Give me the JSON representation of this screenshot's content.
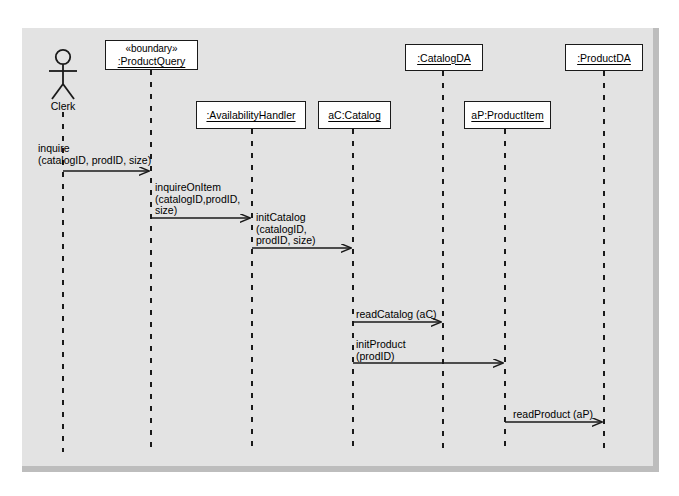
{
  "diagram": {
    "type": "uml-sequence-diagram",
    "background_color": "#e3e3e3",
    "frame_border_color": "#bdbdbd",
    "line_color": "#1a1a1a",
    "box_fill": "#ffffff",
    "actor": {
      "name": "actor-clerk",
      "label": "Clerk",
      "x": 63,
      "head_cy": 58,
      "lifeline_top": 104,
      "lifeline_bottom": 452
    },
    "lifelines": [
      {
        "id": "productquery",
        "stereotype": "«boundary»",
        "label": ":ProductQuery",
        "x": 151,
        "box": {
          "left": 105,
          "top": 40,
          "width": 93,
          "height": 30
        },
        "lifeline_top": 70,
        "lifeline_bottom": 452
      },
      {
        "id": "availabilityhandler",
        "stereotype": "",
        "label": ":AvailabilityHandler",
        "x": 252,
        "box": {
          "left": 196,
          "top": 101,
          "width": 110,
          "height": 28
        },
        "lifeline_top": 129,
        "lifeline_bottom": 452
      },
      {
        "id": "accatalog",
        "stereotype": "",
        "label": "aC:Catalog",
        "x": 353,
        "box": {
          "left": 318,
          "top": 101,
          "width": 73,
          "height": 28
        },
        "lifeline_top": 129,
        "lifeline_bottom": 452
      },
      {
        "id": "catalogda",
        "stereotype": "",
        "label": ":CatalogDA",
        "x": 443,
        "box": {
          "left": 405,
          "top": 44,
          "width": 78,
          "height": 27
        },
        "lifeline_top": 71,
        "lifeline_bottom": 452
      },
      {
        "id": "approductitem",
        "stereotype": "",
        "label": "aP:ProductItem",
        "x": 505,
        "box": {
          "left": 464,
          "top": 101,
          "width": 87,
          "height": 28
        },
        "lifeline_top": 129,
        "lifeline_bottom": 452
      },
      {
        "id": "productda",
        "stereotype": "",
        "label": ":ProductDA",
        "x": 604,
        "box": {
          "left": 565,
          "top": 44,
          "width": 78,
          "height": 27
        },
        "lifeline_top": 71,
        "lifeline_bottom": 452
      }
    ],
    "messages": [
      {
        "id": "msg-inquire",
        "name": "inquire",
        "label_lines": [
          "inquire",
          "(catalogID, prodID, size)"
        ],
        "from_x": 63,
        "to_x": 151,
        "y": 171,
        "label_x": 38,
        "label_y": 143
      },
      {
        "id": "msg-inquireonitem",
        "name": "inquireOnItem",
        "label_lines": [
          "inquireOnItem",
          "(catalogID,prodID,",
          "size)"
        ],
        "from_x": 151,
        "to_x": 252,
        "y": 218,
        "label_x": 155,
        "label_y": 182
      },
      {
        "id": "msg-initcatalog",
        "name": "initCatalog",
        "label_lines": [
          "initCatalog",
          "(catalogID,",
          "prodID, size)"
        ],
        "from_x": 252,
        "to_x": 353,
        "y": 248,
        "label_x": 256,
        "label_y": 212
      },
      {
        "id": "msg-readcatalog",
        "name": "readCatalog",
        "label_lines": [
          "readCatalog (aC)"
        ],
        "from_x": 353,
        "to_x": 443,
        "y": 322,
        "label_x": 356,
        "label_y": 309
      },
      {
        "id": "msg-initproduct",
        "name": "initProduct",
        "label_lines": [
          "initProduct",
          "(prodID)"
        ],
        "from_x": 353,
        "to_x": 505,
        "y": 363,
        "label_x": 356,
        "label_y": 339
      },
      {
        "id": "msg-readproduct",
        "name": "readProduct",
        "label_lines": [
          "readProduct (aP)"
        ],
        "from_x": 505,
        "to_x": 604,
        "y": 422,
        "label_x": 513,
        "label_y": 409
      }
    ]
  }
}
